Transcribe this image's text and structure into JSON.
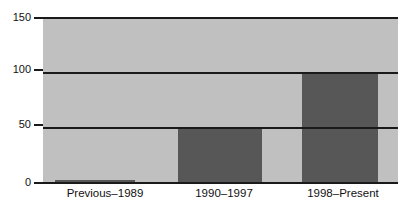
{
  "chart_data": {
    "type": "bar",
    "title": "",
    "subtitle": "",
    "xlabel": "",
    "ylabel": "",
    "categories": [
      "Previous–1989",
      "1990–1997",
      "1998–Present"
    ],
    "values": [
      3,
      50,
      100
    ],
    "series": [
      {
        "name": "",
        "values": [
          3,
          50,
          100
        ]
      }
    ],
    "ylim": [
      0,
      150
    ],
    "yticks": [
      0,
      50,
      100,
      150
    ],
    "ytick_labels": [
      "0",
      "50",
      "100",
      "150"
    ],
    "grid": true,
    "legend": false,
    "legend_position": "none",
    "annotations": [],
    "colors": {
      "bar": "#575757",
      "plot_background": "#c0c0c0",
      "gridline": "#1a1a1a",
      "text": "#111111",
      "page_background": "#ffffff"
    }
  },
  "axes": {
    "y_ticks": [
      {
        "label": "150",
        "value": 150
      },
      {
        "label": "100",
        "value": 100
      },
      {
        "label": "50",
        "value": 50
      },
      {
        "label": "0",
        "value": 0
      }
    ],
    "x_categories": [
      {
        "label": "Previous–1989"
      },
      {
        "label": "1990–1997"
      },
      {
        "label": "1998–Present"
      }
    ]
  },
  "bars": [
    {
      "label": "Previous–1989",
      "value": 3
    },
    {
      "label": "1990–1997",
      "value": 50
    },
    {
      "label": "1998–Present",
      "value": 100
    }
  ]
}
